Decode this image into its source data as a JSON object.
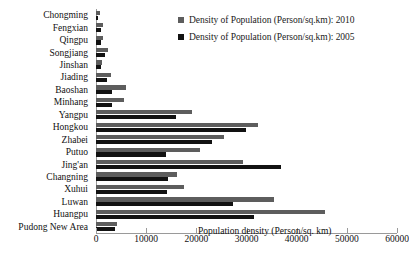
{
  "chart_data": {
    "type": "bar",
    "orientation": "horizontal",
    "title": "",
    "xlabel": "Population density (Person/sq. km)",
    "ylabel": "",
    "xlim": [
      0,
      60000
    ],
    "xticks": [
      0,
      10000,
      20000,
      30000,
      40000,
      50000,
      60000
    ],
    "grid": false,
    "legend_position": "top-right",
    "categories": [
      "Chongming",
      "Fengxian",
      "Qingpu",
      "Songjiang",
      "Jinshan",
      "Jiading",
      "Baoshan",
      "Minhang",
      "Yangpu",
      "Hongkou",
      "Zhabei",
      "Putuo",
      "Jing'an",
      "Changning",
      "Xuhui",
      "Luwan",
      "Huangpu",
      "Pudong New Area"
    ],
    "series": [
      {
        "name": "Density of Population (Person/sq.km): 2010",
        "color": "#5d5d5d",
        "values": [
          700,
          1300,
          1300,
          2400,
          1100,
          3000,
          6000,
          5600,
          19200,
          32300,
          25500,
          20800,
          29300,
          16200,
          17600,
          35500,
          45600,
          4200
        ]
      },
      {
        "name": "Density of Population (Person/sq.km): 2005",
        "color": "#121212",
        "values": [
          400,
          900,
          900,
          1700,
          900,
          2200,
          3200,
          3200,
          16000,
          29900,
          23100,
          14000,
          36900,
          14400,
          14200,
          27300,
          31500,
          3700
        ]
      }
    ]
  },
  "legend": [
    {
      "label": "Density of Population (Person/sq.km): 2010",
      "color": "#5d5d5d"
    },
    {
      "label": "Density of Population (Person/sq.km): 2005",
      "color": "#121212"
    }
  ],
  "axis": {
    "x_title": "Population density (Person/sq. km)",
    "tick_labels": [
      "0",
      "10000",
      "20000",
      "30000",
      "40000",
      "50000",
      "60000"
    ]
  }
}
